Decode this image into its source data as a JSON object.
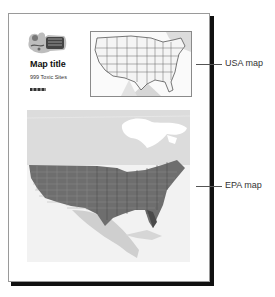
{
  "layout_page": {
    "map_title": "Map title",
    "subtitle": "999 Toxic Sites",
    "logo_icon": "clipart-logo-icon",
    "scalebar_icon": "scale-bar-icon"
  },
  "callouts": [
    {
      "label": "USA map",
      "target": "usa-map-frame"
    },
    {
      "label": "EPA map",
      "target": "epa-map-frame"
    }
  ],
  "colors": {
    "page_border": "#9a9a9a",
    "shadow": "#111111",
    "land_light": "#d9d9d9",
    "data_dense": "#555555",
    "callout_line": "#555555"
  }
}
